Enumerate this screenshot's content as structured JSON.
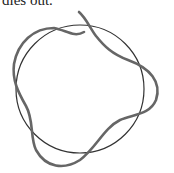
{
  "caption": {
    "text": "dies out."
  },
  "figure": {
    "circle": {
      "cx": 80,
      "cy": 89,
      "r": 64,
      "stroke": "#333333",
      "stroke_width": 1.2
    },
    "wavy_curve": {
      "stroke": "#666666",
      "stroke_width": 2.6,
      "description": "closed three-lobed perturbed loop around circle, with open end at top"
    }
  }
}
